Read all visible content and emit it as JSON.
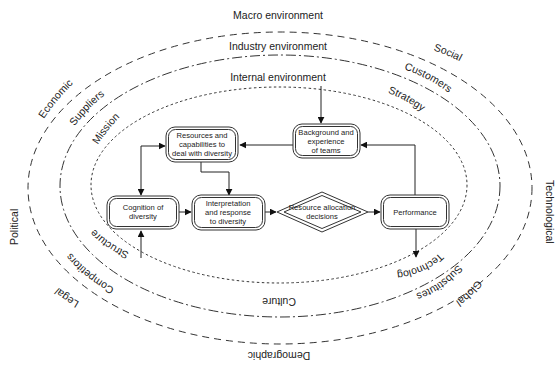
{
  "diagram": {
    "rings": {
      "macro": {
        "title": "Macro environment",
        "labels": {
          "economic": "Economic",
          "social": "Social",
          "political": "Political",
          "technological": "Technological",
          "legal": "Legal",
          "global": "Global",
          "demographic": "Demographic"
        }
      },
      "industry": {
        "title": "Industry environment",
        "labels": {
          "suppliers": "Suppliers",
          "customers": "Customers",
          "competitors": "Competitors",
          "substitutes": "Substitutes"
        }
      },
      "internal": {
        "title": "Internal environment",
        "labels": {
          "mission": "Mission",
          "strategy": "Strategy",
          "structure": "Structure",
          "technology": "Technology",
          "culture": "Culture"
        }
      }
    },
    "nodes": {
      "resources": [
        "Resources and",
        "capabilities to",
        "deal with diversity"
      ],
      "background": [
        "Background and",
        "experience",
        "of teams"
      ],
      "cognition": [
        "Cognition of",
        "diversity"
      ],
      "interpretation": [
        "Interpretation",
        "and response",
        "to diversity"
      ],
      "allocation": [
        "Resource allocation",
        "decisions"
      ],
      "performance": [
        "Performance"
      ]
    }
  }
}
